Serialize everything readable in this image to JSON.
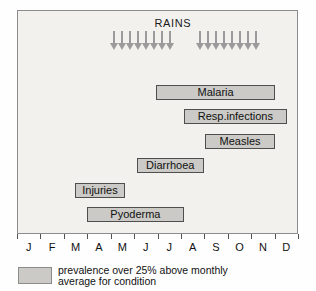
{
  "figure": {
    "legend": {
      "lines": [
        "prevalence over 25% above monthly",
        "average for condition"
      ]
    }
  },
  "chart_data": {
    "type": "bar",
    "variant": "seasonal-occurrence-gantt",
    "title": "RAINS",
    "x_axis": {
      "tick_labels": [
        "J",
        "F",
        "M",
        "A",
        "M",
        "J",
        "J",
        "A",
        "S",
        "O",
        "N",
        "D"
      ],
      "range_months": [
        0,
        12
      ],
      "grid": false
    },
    "rains": {
      "label": "RAINS",
      "arrow_icon": "down-arrow-icon",
      "groups": [
        {
          "start_month": 3.95,
          "end_month": 6.35,
          "arrow_count": 8,
          "approx_period": "May-Jul"
        },
        {
          "start_month": 7.65,
          "end_month": 10.05,
          "arrow_count": 8,
          "approx_period": "mid Aug-Oct"
        }
      ]
    },
    "series": [
      {
        "name": "Malaria",
        "start_month": 5.95,
        "end_month": 11.05,
        "approx_period": "Jul-Nov"
      },
      {
        "name": "Resp.infections",
        "start_month": 7.15,
        "end_month": 11.55,
        "approx_period": "mid Aug-mid Dec"
      },
      {
        "name": "Measles",
        "start_month": 8.05,
        "end_month": 11.05,
        "approx_period": "Sep-Nov"
      },
      {
        "name": "Diarrhoea",
        "start_month": 5.1,
        "end_month": 8.0,
        "approx_period": "mid Jun-Aug"
      },
      {
        "name": "Injuries",
        "start_month": 2.45,
        "end_month": 4.6,
        "approx_period": "mid Mar-mid May"
      },
      {
        "name": "Pyoderma",
        "start_month": 2.95,
        "end_month": 7.15,
        "approx_period": "Apr-mid Aug"
      }
    ],
    "legend_note": "prevalence over 25% above monthly average for condition",
    "legend_position": "bottom-left",
    "colors": {
      "bar_fill": "#cbcac6",
      "bar_border": "#4e4e4e",
      "arrow": "#9b9b9b",
      "plot_bg": "#f3f1ee",
      "frame_border": "#8c8c8c"
    }
  }
}
